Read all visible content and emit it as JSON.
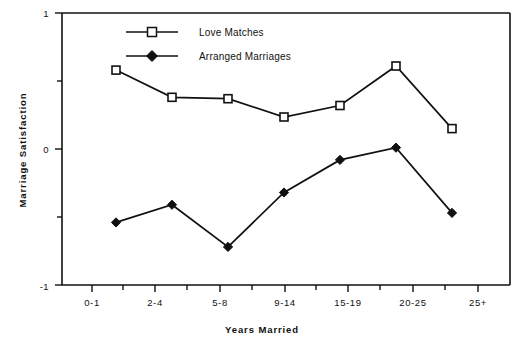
{
  "chart_data": {
    "type": "line",
    "title": "",
    "xlabel": "Years  Married",
    "ylabel": "Marriage  Satisfaction",
    "categories": [
      "0-1",
      "2-4",
      "5-8",
      "9-14",
      "15-19",
      "20-25",
      "25+"
    ],
    "ylim": [
      -1,
      1
    ],
    "ytick_labels": [
      "1",
      "0",
      "-1"
    ],
    "ytick_values": [
      1,
      0,
      -1
    ],
    "yminor_ticks": [
      0.5,
      -0.5
    ],
    "grid": false,
    "legend_position": "top-center-left",
    "series": [
      {
        "name": "Love Matches",
        "marker": "open-square",
        "color": "#111111",
        "values": [
          0.58,
          0.38,
          0.37,
          0.235,
          0.32,
          0.61,
          0.15
        ]
      },
      {
        "name": "Arranged Marriages",
        "marker": "filled-diamond",
        "color": "#111111",
        "values": [
          -0.54,
          -0.41,
          -0.72,
          -0.32,
          -0.08,
          0.01,
          -0.47
        ]
      }
    ]
  },
  "axes": {
    "y_label": "Marriage  Satisfaction",
    "x_label": "Years  Married",
    "y_max_label": "1",
    "y_zero_label": "0",
    "y_min_label": "-1"
  },
  "legend": {
    "entries": [
      {
        "label": "Love Matches",
        "marker": "open-square-icon"
      },
      {
        "label": "Arranged Marriages",
        "marker": "filled-diamond-icon"
      }
    ]
  }
}
